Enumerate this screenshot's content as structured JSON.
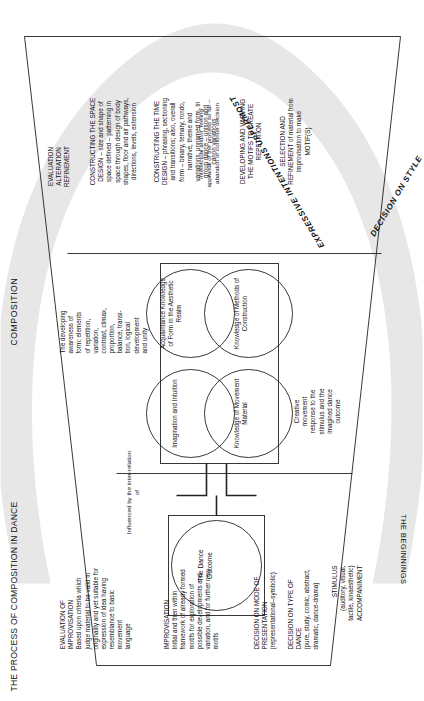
{
  "headings": {
    "main_title": "THE PROCESS OF COMPOSITION IN DANCE",
    "composition": "COMPOSITION",
    "beginnings": "THE BEGINNINGS",
    "expressive_intentions": "EXPRESSIVE INTENTIONS UPPERMOST",
    "decision_on_style": "DECISION ON STYLE"
  },
  "beginnings_column": {
    "stimulus": "STIMULUS\n(auditory, visual,\ntactile, kinaesthetic)\nACCOMPANIMENT",
    "type_of_dance": "DECISION ON TYPE OF\nDANCE\n(pure, study, comic, abstract,\ndramatic, dance-drama)",
    "mode_of_presentation": "DECISION ON MODE OF\nPRESENTATION\n(representational–symbolic)",
    "improvisation": "IMPROVISATION\nInitial and then within\nframework of already formed\nmotifs for exploration of\npossible developments and\nvariation, and for further new\nmotifs",
    "evaluation_of_improvisation": "EVALUATION OF\nIMPROVISATION\nBased upon criteria which\njudge material to be valid in\noriginality and yet suitable for\nexpression of idea having\nresemblance to basic\nmovement\nlanguage"
  },
  "composition_column": {
    "evaluation": "EVALUATION\nALTERATION\nREFINEMENT",
    "constructing_space": "CONSTRUCTING THE SPACE\nDESIGN – size and shape of\nspace defined – patterning in\nspace through design of body\nshapes, floor and air pathways,\ndirections, levels, extension",
    "constructing_time": "CONSTRUCTING THE TIME\nDESIGN – phrasing, sectioning\nand transitions; also, overall\nform – binary, ternary, rondo,\nnarrative, theme and\nvariations, unnamed form. In\ngroup dance – unison and\ncanon variations",
    "developing_motifs": "DEVELOPING AND VARYING\nTHE MOTIFS TO CREATE\nREPETITION",
    "selection_refinement": "SELECTION AND\nREFINEMENT of material from\nimprovisation to make\nMOTIF(S)"
  },
  "centre": {
    "outcome": "The\nDance\nOutcome",
    "influenced_by": "Influenced by\nthe inter-relation of",
    "creative_movement": "Creative\nmovement\nresponse to the\nstimulus and the\nimagined dance\noutcome",
    "developing_awareness": "The developing\nawareness of\nform: elements\nof repetition,\nvariation,\ncontrast, climax,\nproportion,\nbalance, transi-\ntion, logical\ndevelopment\nand unity",
    "appraisal": "Intellectual and/or\n'feeling' appraisal of the\nprocess so far – abandon or\ncontinue decision"
  },
  "circles": [
    {
      "label": "Imagination\nand\nIntuition"
    },
    {
      "label": "Knowledge of\nMovement\nMaterial"
    },
    {
      "label": "Acquaintance\nKnowledge of\nForm in the\nAesthetic\nRealm"
    },
    {
      "label": "Knowledge of\nMethods of\nConstruction"
    }
  ],
  "colors": {
    "stroke": "#222222",
    "arc": "#e4e4e4",
    "background": "#ffffff",
    "text": "#111111"
  }
}
